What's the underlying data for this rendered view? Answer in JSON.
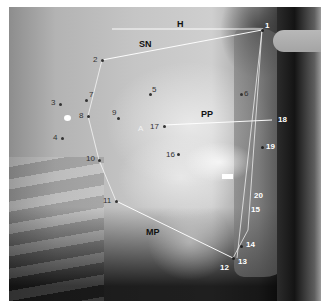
{
  "image": {
    "type": "lateral cephalometric radiograph",
    "bounds": {
      "x": 9,
      "y": 7,
      "width": 312,
      "height": 294
    }
  },
  "reference_lines": [
    {
      "id": "H",
      "label": "H",
      "x1": 112,
      "y1": 29,
      "x2": 263,
      "y2": 29,
      "label_x": 177,
      "label_y": 20,
      "tone": "dark"
    },
    {
      "id": "SN",
      "label": "SN",
      "x1": 102,
      "y1": 60,
      "x2": 262,
      "y2": 30,
      "label_x": 139,
      "label_y": 40,
      "tone": "dark"
    },
    {
      "id": "PP",
      "label": "PP",
      "x1": 164,
      "y1": 125,
      "x2": 272,
      "y2": 120,
      "label_x": 201,
      "label_y": 110,
      "tone": "dark"
    },
    {
      "id": "MP",
      "label": "MP",
      "x1": 116,
      "y1": 201,
      "x2": 233,
      "y2": 258,
      "label_x": 146,
      "label_y": 228,
      "tone": "dark"
    }
  ],
  "polygon_lines": [
    {
      "x1": 102,
      "y1": 60,
      "x2": 88,
      "y2": 116
    },
    {
      "x1": 88,
      "y1": 116,
      "x2": 99,
      "y2": 160
    },
    {
      "x1": 99,
      "y1": 160,
      "x2": 116,
      "y2": 201
    },
    {
      "x1": 262,
      "y1": 30,
      "x2": 248,
      "y2": 230
    },
    {
      "x1": 262,
      "y1": 30,
      "x2": 237,
      "y2": 258
    },
    {
      "x1": 248,
      "y1": 230,
      "x2": 233,
      "y2": 258
    }
  ],
  "landmarks": [
    {
      "num": "1",
      "dot_x": 262,
      "dot_y": 30,
      "label_x": 265,
      "label_y": 22,
      "tone": "light"
    },
    {
      "num": "2",
      "dot_x": 102,
      "dot_y": 60,
      "label_x": 93,
      "label_y": 56,
      "tone": "dark"
    },
    {
      "num": "3",
      "dot_x": 60,
      "dot_y": 104,
      "label_x": 51,
      "label_y": 99,
      "tone": "dark"
    },
    {
      "num": "4",
      "dot_x": 62,
      "dot_y": 138,
      "label_x": 53,
      "label_y": 134,
      "tone": "dark"
    },
    {
      "num": "5",
      "dot_x": 150,
      "dot_y": 94,
      "label_x": 152,
      "label_y": 86,
      "tone": "dark"
    },
    {
      "num": "6",
      "dot_x": 241,
      "dot_y": 94,
      "label_x": 244,
      "label_y": 90,
      "tone": "dark"
    },
    {
      "num": "7",
      "dot_x": 86,
      "dot_y": 100,
      "label_x": 89,
      "label_y": 91,
      "tone": "dark"
    },
    {
      "num": "8",
      "dot_x": 88,
      "dot_y": 116,
      "label_x": 79,
      "label_y": 112,
      "tone": "dark"
    },
    {
      "num": "9",
      "dot_x": 118,
      "dot_y": 118,
      "label_x": 112,
      "label_y": 109,
      "tone": "dark"
    },
    {
      "num": "10",
      "dot_x": 99,
      "dot_y": 160,
      "label_x": 86,
      "label_y": 155,
      "tone": "dark"
    },
    {
      "num": "11",
      "dot_x": 116,
      "dot_y": 201,
      "label_x": 103,
      "label_y": 197,
      "tone": "dark"
    },
    {
      "num": "12",
      "dot_x": null,
      "dot_y": null,
      "label_x": 220,
      "label_y": 264,
      "tone": "light"
    },
    {
      "num": "13",
      "dot_x": 233,
      "dot_y": 258,
      "label_x": 238,
      "label_y": 258,
      "tone": "light"
    },
    {
      "num": "14",
      "dot_x": 241,
      "dot_y": 246,
      "label_x": 246,
      "label_y": 241,
      "tone": "light"
    },
    {
      "num": "15",
      "dot_x": null,
      "dot_y": null,
      "label_x": 251,
      "label_y": 206,
      "tone": "light"
    },
    {
      "num": "16",
      "dot_x": 178,
      "dot_y": 154,
      "label_x": 166,
      "label_y": 151,
      "tone": "dark"
    },
    {
      "num": "17",
      "dot_x": 164,
      "dot_y": 126,
      "label_x": 150,
      "label_y": 123,
      "tone": "dark"
    },
    {
      "num": "18",
      "dot_x": null,
      "dot_y": null,
      "label_x": 278,
      "label_y": 116,
      "tone": "light"
    },
    {
      "num": "19",
      "dot_x": 262,
      "dot_y": 147,
      "label_x": 266,
      "label_y": 143,
      "tone": "light"
    },
    {
      "num": "20",
      "dot_x": null,
      "dot_y": null,
      "label_x": 254,
      "label_y": 192,
      "tone": "light"
    }
  ],
  "marker_A": {
    "label": "A",
    "x": 138,
    "y": 125
  }
}
